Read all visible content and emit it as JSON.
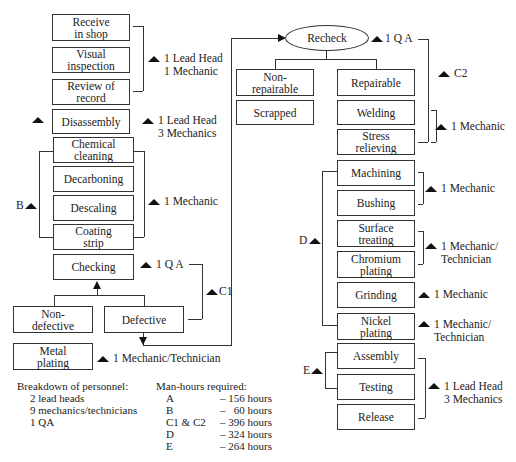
{
  "left_column": {
    "boxes": [
      "Receive\nin shop",
      "Visual\ninspection",
      "Review of\nrecord",
      "Disassembly",
      "Chemical\ncleaning",
      "Decarboning",
      "Descaling",
      "Coating\nstrip",
      "Checking",
      "Non-\ndefective",
      "Defective",
      "Metal\nplating"
    ],
    "annotations": {
      "a_staff": "1 Lead Head\n1 Mechanic",
      "disassembly_staff": "1 Lead Head\n3 Mechanics",
      "b_staff": "1 Mechanic",
      "checking_staff": "1 Q A",
      "metal_plating_staff": "1 Mechanic/Technician",
      "b_label": "B",
      "c1_label": "C1"
    }
  },
  "right_column": {
    "recheck": "Recheck",
    "recheck_staff": "1 Q A",
    "c2_label": "C2",
    "boxes": [
      "Non-\nrepairable",
      "Scrapped",
      "Repairable",
      "Welding",
      "Stress\nrelieving",
      "Machining",
      "Bushing",
      "Surface\ntreating",
      "Chromium\nplating",
      "Grinding",
      "Nickel\nplating",
      "Assembly",
      "Testing",
      "Release"
    ],
    "annotations": {
      "welding_staff": "1 Mechanic",
      "machining_staff": "1 Mechanic",
      "surface_staff": "1 Mechanic/\nTechnician",
      "grinding_staff": "1 Mechanic",
      "nickel_staff": "1 Mechanic/\nTechnician",
      "assembly_staff": "1 Lead Head\n3 Mechanics",
      "d_label": "D",
      "e_label": "E"
    }
  },
  "footer": {
    "personnel_title": "Breakdown of personnel:",
    "personnel": [
      "2 lead heads",
      "9 mechanics/technicians",
      "1 QA"
    ],
    "manhours_title": "Man-hours required:",
    "manhours": [
      {
        "group": "A",
        "hours": "– 156 hours"
      },
      {
        "group": "B",
        "hours": "–   60 hours"
      },
      {
        "group": "C1 & C2",
        "hours": "– 396 hours"
      },
      {
        "group": "D",
        "hours": "– 324 hours"
      },
      {
        "group": "E",
        "hours": "– 264 hours"
      }
    ]
  }
}
